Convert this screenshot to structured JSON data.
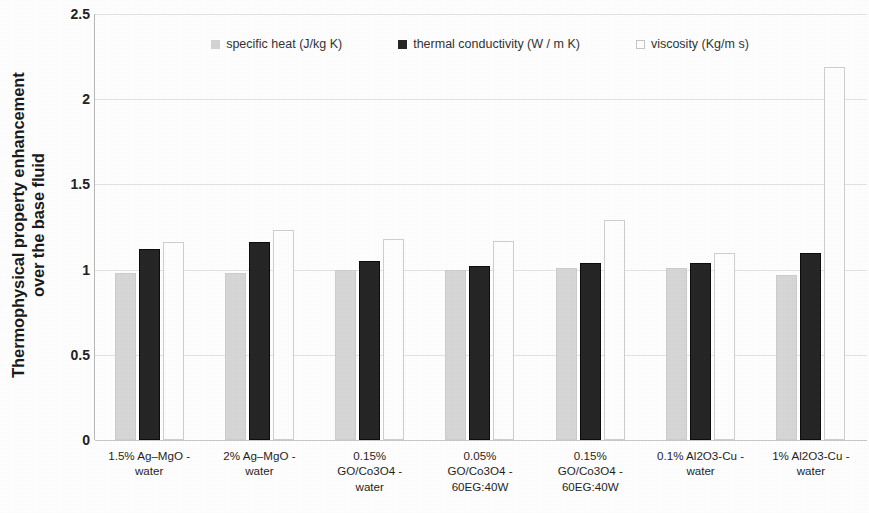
{
  "chart_data": {
    "type": "bar",
    "title": "",
    "xlabel": "",
    "ylabel": "Thermophysical property enhancement over the base fluid",
    "ylabel_line1": "Thermophysical property enhancement",
    "ylabel_line2": "over the base fluid",
    "ylim": [
      0,
      2.5
    ],
    "yticks": [
      "0",
      "0.5",
      "1",
      "1.5",
      "2",
      "2.5"
    ],
    "ytick_values": [
      0,
      0.5,
      1,
      1.5,
      2,
      2.5
    ],
    "grid": true,
    "legend_position": "top-center",
    "categories": [
      "1.5% Ag–MgO -\nwater",
      "2% Ag–MgO -\nwater",
      "0.15%\nGO/Co3O4 -\nwater",
      "0.05%\nGO/Co3O4 -\n60EG:40W",
      "0.15%\nGO/Co3O4 -\n60EG:40W",
      "0.1% Al2O3-Cu -\nwater",
      "1% Al2O3-Cu -\nwater"
    ],
    "series": [
      {
        "name": "specific heat (J/kg K)",
        "color": "#d7d7d7",
        "values": [
          0.98,
          0.98,
          1.0,
          1.0,
          1.01,
          1.01,
          0.97
        ]
      },
      {
        "name": "thermal conductivity (W / m K)",
        "color": "#262626",
        "values": [
          1.12,
          1.16,
          1.05,
          1.02,
          1.04,
          1.04,
          1.1
        ]
      },
      {
        "name": "viscosity (Kg/m s)",
        "color": "#ffffff",
        "values": [
          1.16,
          1.23,
          1.18,
          1.17,
          1.29,
          1.1,
          2.19
        ]
      }
    ]
  },
  "legend": {
    "items": [
      {
        "label": "specific heat (J/kg K)",
        "swatch": "light-gray-square"
      },
      {
        "label": "thermal conductivity (W / m K)",
        "swatch": "dark-square"
      },
      {
        "label": "viscosity (Kg/m s)",
        "swatch": "white-square"
      }
    ]
  },
  "colors": {
    "specific_heat": "#d7d7d7",
    "thermal_conductivity": "#262626",
    "viscosity": "#ffffff",
    "gridline": "#e3e3e3",
    "axis": "#b9b9b9",
    "text": "#1a1a1a"
  }
}
